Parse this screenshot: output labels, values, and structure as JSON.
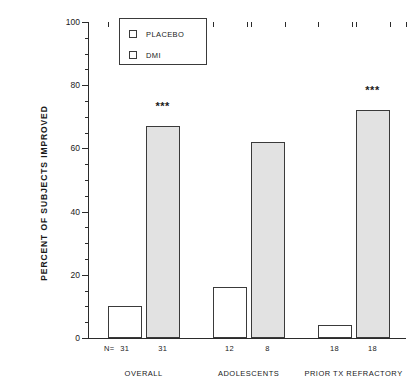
{
  "chart_data": {
    "type": "bar",
    "title": "",
    "xlabel": "",
    "ylabel": "PERCENT OF SUBJECTS IMPROVED",
    "ylim": [
      0,
      100
    ],
    "ytick_labels": [
      "0",
      "20",
      "40",
      "60",
      "80",
      "100"
    ],
    "ytick_values": [
      0,
      20,
      40,
      60,
      80,
      100
    ],
    "minor_tick_step": 5,
    "grid": false,
    "legend_position": "top-center",
    "categories": [
      "OVERALL",
      "ADOLESCENTS",
      "PRIOR TX REFRACTORY"
    ],
    "series": [
      {
        "name": "PLACEBO",
        "fill": "#ffffff",
        "values": [
          10,
          16,
          4
        ]
      },
      {
        "name": "DMI",
        "fill": "#e2e2e2",
        "values": [
          67,
          62,
          72
        ]
      }
    ],
    "n_row_prefix": "N=",
    "n_values": [
      {
        "group": "OVERALL",
        "placebo": "31",
        "dmi": "31"
      },
      {
        "group": "ADOLESCENTS",
        "placebo": "12",
        "dmi": "8"
      },
      {
        "group": "PRIOR TX REFRACTORY",
        "placebo": "18",
        "dmi": "18"
      }
    ],
    "annotations": [
      {
        "text": "***",
        "group": "OVERALL",
        "series": "DMI"
      },
      {
        "text": "***",
        "group": "PRIOR TX REFRACTORY",
        "series": "DMI"
      }
    ]
  },
  "colors": {
    "axis": "#2b2b2b",
    "bar_outline": "#3a3a3a",
    "placebo_fill": "#ffffff",
    "dmi_fill": "#e2e2e2",
    "background": "#ffffff"
  }
}
